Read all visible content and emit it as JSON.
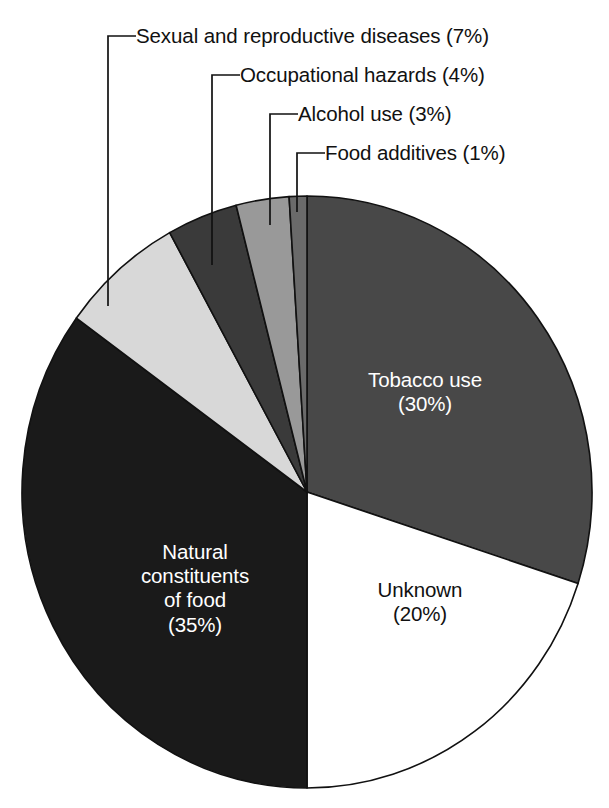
{
  "chart_data": {
    "type": "pie",
    "title": "",
    "subtitle": "",
    "xlabel": "",
    "ylabel": "",
    "legend_position": "none",
    "grid": false,
    "units": "percent",
    "total": 100,
    "start_angle_deg": 0,
    "direction": "clockwise",
    "categories": [
      "Tobacco use",
      "Unknown",
      "Natural constituents of food",
      "Sexual and reproductive diseases",
      "Occupational hazards",
      "Alcohol use",
      "Food additives"
    ],
    "values": [
      30,
      20,
      35,
      7,
      4,
      3,
      1
    ],
    "slices": [
      {
        "name": "Tobacco use",
        "value": 30,
        "percent_text": "(30%)",
        "color": "#484848",
        "label_placement": "inside",
        "label_text": "Tobacco use\n(30%)",
        "label_color": "#ffffff"
      },
      {
        "name": "Unknown",
        "value": 20,
        "percent_text": "(20%)",
        "color": "#ffffff",
        "label_placement": "inside",
        "label_text": "Unknown\n(20%)",
        "label_color": "#111111"
      },
      {
        "name": "Natural constituents of food",
        "value": 35,
        "percent_text": "(35%)",
        "color": "#1a1a1a",
        "label_placement": "inside",
        "label_text": "Natural\nconstituents\nof food\n(35%)",
        "label_color": "#ffffff"
      },
      {
        "name": "Sexual and reproductive diseases",
        "value": 7,
        "percent_text": "(7%)",
        "color": "#d8d8d8",
        "label_placement": "callout",
        "label_text": "Sexual and reproductive diseases (7%)",
        "label_color": "#111111"
      },
      {
        "name": "Occupational hazards",
        "value": 4,
        "percent_text": "(4%)",
        "color": "#3a3a3a",
        "label_placement": "callout",
        "label_text": "Occupational hazards (4%)",
        "label_color": "#111111"
      },
      {
        "name": "Alcohol use",
        "value": 3,
        "percent_text": "(3%)",
        "color": "#999999",
        "label_placement": "callout",
        "label_text": "Alcohol use (3%)",
        "label_color": "#111111"
      },
      {
        "name": "Food additives",
        "value": 1,
        "percent_text": "(1%)",
        "color": "#6a6a6a",
        "label_placement": "callout",
        "label_text": "Food additives (1%)",
        "label_color": "#111111"
      }
    ]
  },
  "callouts": [
    {
      "text": "Sexual and reproductive diseases (7%)",
      "name": "callout-sexual-and-reproductive-diseases"
    },
    {
      "text": "Occupational hazards (4%)",
      "name": "callout-occupational-hazards"
    },
    {
      "text": "Alcohol use (3%)",
      "name": "callout-alcohol-use"
    },
    {
      "text": "Food additives (1%)",
      "name": "callout-food-additives"
    }
  ],
  "inside_labels": {
    "tobacco": "Tobacco use\n(30%)",
    "unknown": "Unknown\n(20%)",
    "natural": "Natural\nconstituents\nof food\n(35%)"
  },
  "colors": {
    "tobacco": "#484848",
    "unknown": "#ffffff",
    "natural": "#1a1a1a",
    "sexual": "#d8d8d8",
    "occupational": "#3a3a3a",
    "alcohol": "#999999",
    "additives": "#6a6a6a",
    "outline": "#111111",
    "background": "#ffffff",
    "leader_line": "#111111"
  }
}
